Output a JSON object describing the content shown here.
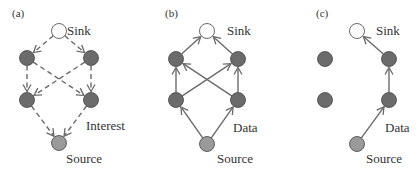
{
  "panels": [
    {
      "id": "a",
      "label": "(a)",
      "phase": "interest-propagation",
      "edge_style": "dashed",
      "annotation": "Interest",
      "nodes": [
        {
          "id": "sink",
          "role": "sink",
          "label": "Sink"
        },
        {
          "id": "ul",
          "role": "relay"
        },
        {
          "id": "ur",
          "role": "relay"
        },
        {
          "id": "ll",
          "role": "relay"
        },
        {
          "id": "lr",
          "role": "relay"
        },
        {
          "id": "source",
          "role": "source",
          "label": "Source"
        }
      ],
      "edges": [
        [
          "sink",
          "ul"
        ],
        [
          "sink",
          "ur"
        ],
        [
          "ul",
          "ll"
        ],
        [
          "ul",
          "lr"
        ],
        [
          "ur",
          "lr"
        ],
        [
          "ur",
          "ll"
        ],
        [
          "ll",
          "source"
        ],
        [
          "lr",
          "source"
        ]
      ]
    },
    {
      "id": "b",
      "label": "(b)",
      "phase": "initial-data-flooding",
      "edge_style": "solid",
      "annotation": "Data",
      "nodes": [
        {
          "id": "sink",
          "role": "sink",
          "label": "Sink"
        },
        {
          "id": "ul",
          "role": "relay"
        },
        {
          "id": "ur",
          "role": "relay"
        },
        {
          "id": "ll",
          "role": "relay"
        },
        {
          "id": "lr",
          "role": "relay"
        },
        {
          "id": "source",
          "role": "source",
          "label": "Source"
        }
      ],
      "edges": [
        [
          "source",
          "ll"
        ],
        [
          "source",
          "lr"
        ],
        [
          "ll",
          "ul"
        ],
        [
          "ll",
          "ur"
        ],
        [
          "lr",
          "ur"
        ],
        [
          "lr",
          "ul"
        ],
        [
          "ul",
          "sink"
        ],
        [
          "ur",
          "sink"
        ]
      ]
    },
    {
      "id": "c",
      "label": "(c)",
      "phase": "reinforced-path",
      "edge_style": "solid",
      "annotation": "Data",
      "nodes": [
        {
          "id": "sink",
          "role": "sink",
          "label": "Sink"
        },
        {
          "id": "ul",
          "role": "relay"
        },
        {
          "id": "ur",
          "role": "relay"
        },
        {
          "id": "ll",
          "role": "relay"
        },
        {
          "id": "lr",
          "role": "relay"
        },
        {
          "id": "source",
          "role": "source",
          "label": "Source"
        }
      ],
      "edges": [
        [
          "source",
          "lr"
        ],
        [
          "lr",
          "ur"
        ],
        [
          "ur",
          "sink"
        ]
      ]
    }
  ],
  "colors": {
    "sink_fill": "#ffffff",
    "relay_fill": "#6b6b6b",
    "source_fill": "#9a9a9a",
    "edge": "#6a6a6a",
    "text": "#333333"
  }
}
